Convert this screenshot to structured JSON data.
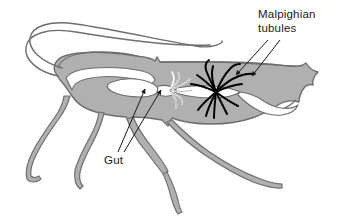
{
  "figure": {
    "organism": "cockroach-like insect, lateral view",
    "background_color": "#ffffff"
  },
  "colors": {
    "body_fill": "#b0b0b0",
    "body_stroke": "#6e6e6e",
    "gut_fill": "#ffffff",
    "gut_stroke": "#6e6e6e",
    "tubules": "#000000",
    "leader_line": "#1a1a1a",
    "text": "#1a1a1a"
  },
  "labels": [
    {
      "id": "malpighian-tubules",
      "lines": [
        "Malpighian",
        "tubules"
      ],
      "line1": "Malpighian",
      "line2": "tubules",
      "x": 258,
      "y": 18,
      "pointer_count": 2,
      "points_to": "black branching tubules in abdomen"
    },
    {
      "id": "gut",
      "lines": [
        "Gut"
      ],
      "line1": "Gut",
      "x": 104,
      "y": 160,
      "pointer_count": 2,
      "points_to": "white gut tube in thorax and abdomen"
    }
  ],
  "structures": [
    {
      "name": "antennae",
      "count": 2,
      "color": "#6e6e6e"
    },
    {
      "name": "head",
      "color": "#b0b0b0"
    },
    {
      "name": "thorax",
      "color": "#b0b0b0"
    },
    {
      "name": "abdomen",
      "color": "#b0b0b0"
    },
    {
      "name": "legs",
      "count": 4,
      "color": "#b0b0b0"
    },
    {
      "name": "gut",
      "color": "#ffffff"
    },
    {
      "name": "gastric-caeca",
      "color": "#ffffff"
    },
    {
      "name": "malpighian-tubules",
      "color": "#000000"
    }
  ]
}
